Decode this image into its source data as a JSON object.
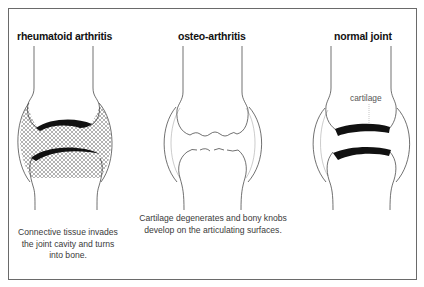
{
  "panels": [
    {
      "id": "rheumatoid",
      "title": "rheumatoid arthritis",
      "caption_lines": [
        "Connective tissue invades",
        "the joint cavity and turns",
        "into bone."
      ]
    },
    {
      "id": "osteo",
      "title": "osteo-arthritis",
      "caption_lines": [
        "Cartilage degenerates and bony knobs",
        "develop on the articulating surfaces."
      ]
    },
    {
      "id": "normal",
      "title": "normal joint",
      "label": "cartilage"
    }
  ],
  "colors": {
    "line": "#333333",
    "cartilage": "#111111",
    "frame": "#6a6a6a",
    "caption": "#3a3a3a"
  }
}
